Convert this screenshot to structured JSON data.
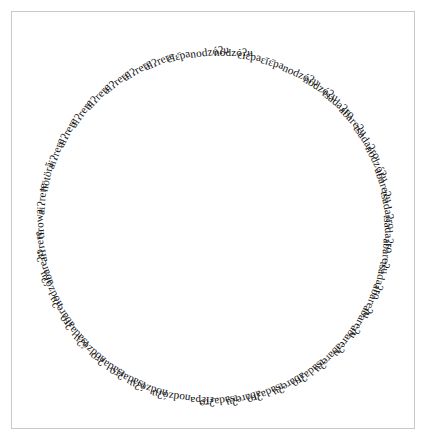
{
  "figure": {
    "title": "",
    "background_color": "#ffffff",
    "border_color": "#c9c9c9",
    "text_color": "#111111"
  },
  "chart_data": {
    "type": "scatter",
    "title": "",
    "subtitle": "",
    "xlabel": "",
    "ylabel": "",
    "grid": false,
    "legend_position": "none",
    "layout": "radial-word-ring",
    "center_x": 214,
    "center_y": 221,
    "radius": 168,
    "start_angle_deg": -90,
    "count": 52,
    "vocabulary": [
      "aiʔrere",
      "hötörã",
      "tirowa",
      "abareʔu",
      "nodzóʔu",
      "tsadaʔro",
      "εīε̄pa"
    ],
    "labels": [
      "nodzóʔu",
      "εīε̄pa",
      "εīε̄pa",
      "nodzóʔu",
      "nodzóʔu",
      "tsadaʔro",
      "abareʔu",
      "tsadaʔro",
      "nodzóʔu",
      "abareʔu",
      "tsadaʔro",
      "tsadaʔro",
      "abareʔu",
      "tsadaʔro",
      "abareʔu",
      "abareʔu",
      "abareʔu",
      "abareʔu",
      "tsadaʔro",
      "abareʔu",
      "tsadaʔro",
      "abareʔu",
      "tsadaʔro",
      "εīε̄pa",
      "nodzóʔu",
      "nodzóʔu",
      "tsadaʔro",
      "tsadaʔro",
      "nodzóʔu",
      "tsadaʔro",
      "abareʔu",
      "nodzóʔu",
      "abareʔu",
      "aiʔrere",
      "tirowa",
      "aiʔrere",
      "hötörã",
      "aiʔrere",
      "aiʔrere",
      "aiʔrere",
      "aiʔrere",
      "aiʔrere",
      "aiʔrere",
      "aiʔrere",
      "εīε̄pa",
      "nodzóʔu"
    ],
    "word_counts": [
      {
        "word": "aiʔrere",
        "count": 9
      },
      {
        "word": "abareʔu",
        "count": 12
      },
      {
        "word": "tsadaʔro",
        "count": 12
      },
      {
        "word": "nodzóʔu",
        "count": 9
      },
      {
        "word": "εīε̄pa",
        "count": 4
      },
      {
        "word": "hötörã",
        "count": 1
      },
      {
        "word": "tirowa",
        "count": 1
      }
    ]
  }
}
